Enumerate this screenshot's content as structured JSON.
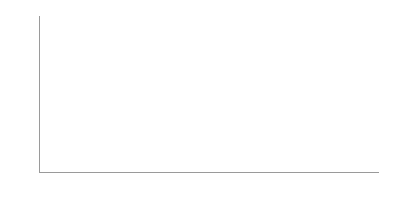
{
  "chart_data": {
    "type": "bar",
    "subtype": "stacked-100-percent",
    "title": "",
    "xlabel": "年份",
    "ylabel": "",
    "categories": [
      "2001",
      "2002",
      "2003",
      "2004",
      "2005",
      "2006",
      "2007",
      "2008",
      "2009",
      "2010",
      "2011",
      "2012",
      "2013",
      "2014",
      "2015",
      "2016"
    ],
    "ylim": [
      0,
      100
    ],
    "ytick_labels": [
      "100%",
      "90%",
      "80%",
      "70%",
      "60%",
      "50%",
      "40%",
      "30%",
      "20%",
      "10%",
      "0"
    ],
    "ytick_values": [
      100,
      90,
      80,
      70,
      60,
      50,
      40,
      30,
      20,
      10,
      0
    ],
    "grid": false,
    "legend": "none",
    "series": [
      {
        "name": "segment-bottom",
        "color": "#2f2f2f",
        "values": [
          42,
          41,
          43,
          45,
          46,
          47,
          48,
          50,
          52,
          55,
          56,
          57,
          58,
          59,
          60,
          60
        ]
      },
      {
        "name": "segment-middle",
        "color": "#565656",
        "values": [
          24,
          25,
          23,
          22,
          21,
          20,
          21,
          22,
          20,
          26,
          35,
          34,
          33,
          32,
          31,
          31
        ]
      },
      {
        "name": "segment-top",
        "color": "#b9b9b9",
        "values": [
          34,
          34,
          34,
          33,
          33,
          33,
          31,
          28,
          28,
          19,
          9,
          9,
          9,
          9,
          9,
          9
        ]
      }
    ],
    "cumulative_top_of_middle": [
      66,
      66,
      66,
      67,
      67,
      67,
      69,
      72,
      72,
      81,
      91,
      91,
      91,
      91,
      91,
      91
    ]
  }
}
